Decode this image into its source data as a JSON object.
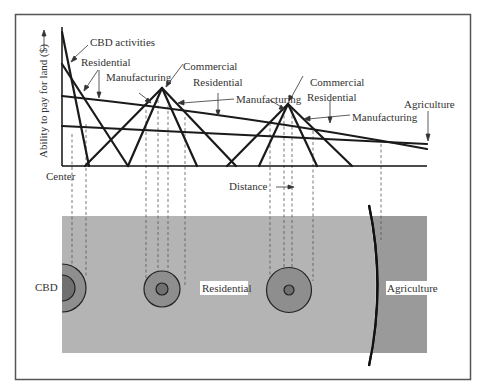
{
  "figure": {
    "y_axis_label": "Ability to pay for land ($)",
    "x_axis_label": "Distance",
    "origin_label": "Center"
  },
  "curve_labels": {
    "cbd_activities": "CBD activities",
    "residential_1": "Residential",
    "manufacturing_1": "Manufacturing",
    "commercial_1": "Commercial",
    "residential_2": "Residential",
    "manufacturing_2": "Manufacturing",
    "commercial_2": "Commercial",
    "residential_3": "Residential",
    "manufacturing_3": "Manufacturing",
    "agriculture": "Agriculture"
  },
  "map_labels": {
    "cbd": "CBD",
    "residential": "Residential",
    "agriculture": "Agriculture"
  },
  "colors": {
    "frame": "#555555",
    "line": "#1a1a1a",
    "residential_zone": "#b4b4b4",
    "agriculture_zone": "#9a9a9a",
    "ring_outer": "#8e8e8e",
    "ring_inner": "#707070"
  }
}
